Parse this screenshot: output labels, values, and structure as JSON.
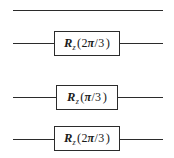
{
  "figure": {
    "type": "quantum-circuit-diagram",
    "background_color": "#ffffff",
    "line_color": "#2b2b2b",
    "wire_count": 4,
    "wires": [
      {
        "index": 0,
        "label": "wire-1",
        "has_gate": false,
        "segments": [
          {
            "x": 13,
            "width": 150
          }
        ]
      },
      {
        "index": 1,
        "label": "wire-2",
        "has_gate": true,
        "segments": [
          {
            "x": 13,
            "width": 41
          },
          {
            "x": 120,
            "width": 43
          }
        ],
        "gate": {
          "name": "rz-gate",
          "box": {
            "x": 54,
            "y": 31,
            "width": 66,
            "height": 25
          },
          "symbol": "R",
          "subscript": "z",
          "open_paren": "(",
          "numerator": "2",
          "pi": "π",
          "slash": "/",
          "denominator": "3",
          "close_paren": ")",
          "text": "R_z(2π/3)",
          "angle": "2π/3"
        }
      },
      {
        "index": 2,
        "label": "wire-3",
        "has_gate": true,
        "segments": [
          {
            "x": 13,
            "width": 43
          },
          {
            "x": 118,
            "width": 45
          }
        ],
        "gate": {
          "name": "rz-gate",
          "box": {
            "x": 56,
            "y": 85,
            "width": 62,
            "height": 25
          },
          "symbol": "R",
          "subscript": "z",
          "open_paren": "(",
          "numerator": "",
          "pi": "π",
          "slash": "/",
          "denominator": "3",
          "close_paren": ")",
          "text": "R_z(π/3)",
          "angle": "π/3"
        }
      },
      {
        "index": 3,
        "label": "wire-4",
        "has_gate": true,
        "segments": [
          {
            "x": 13,
            "width": 41
          },
          {
            "x": 120,
            "width": 43
          }
        ],
        "gate": {
          "name": "rz-gate",
          "box": {
            "x": 54,
            "y": 126,
            "width": 66,
            "height": 25
          },
          "symbol": "R",
          "subscript": "z",
          "open_paren": "(",
          "numerator": "2",
          "pi": "π",
          "slash": "/",
          "denominator": "3",
          "close_paren": ")",
          "text": "R_z(2π/3)",
          "angle": "2π/3"
        }
      }
    ],
    "wire_y": [
      10,
      43,
      97,
      139
    ]
  }
}
